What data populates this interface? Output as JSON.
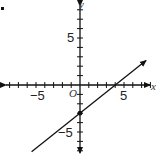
{
  "chart_data": {
    "type": "line",
    "title": "",
    "xlabel": "x",
    "ylabel": "y",
    "origin_label": "O",
    "xlim": [
      -8.5,
      8
    ],
    "ylim": [
      -7.5,
      8.5
    ],
    "x_ticks": [
      -8,
      -7,
      -6,
      -5,
      -4,
      -3,
      -2,
      -1,
      1,
      2,
      3,
      4,
      5,
      6,
      7,
      8
    ],
    "y_ticks": [
      -7,
      -6,
      -5,
      -4,
      -3,
      -2,
      -1,
      1,
      2,
      3,
      4,
      5,
      6,
      7,
      8
    ],
    "tick_labels": {
      "x": [
        {
          "value": -5,
          "text": "−5"
        },
        {
          "value": 5,
          "text": "5"
        }
      ],
      "y": [
        {
          "value": 5,
          "text": "5"
        },
        {
          "value": -5,
          "text": "−5"
        }
      ]
    },
    "grid": false,
    "series": [
      {
        "name": "line",
        "equation": "y = 0.75x - 3",
        "slope": 0.75,
        "intercept": -3,
        "x": [
          -5.5,
          7.5
        ],
        "y": [
          -7.1,
          2.6
        ],
        "arrow_end": "upper-right"
      }
    ],
    "points": [
      {
        "x": 0,
        "y": -3,
        "label": "",
        "filled": true
      }
    ]
  }
}
